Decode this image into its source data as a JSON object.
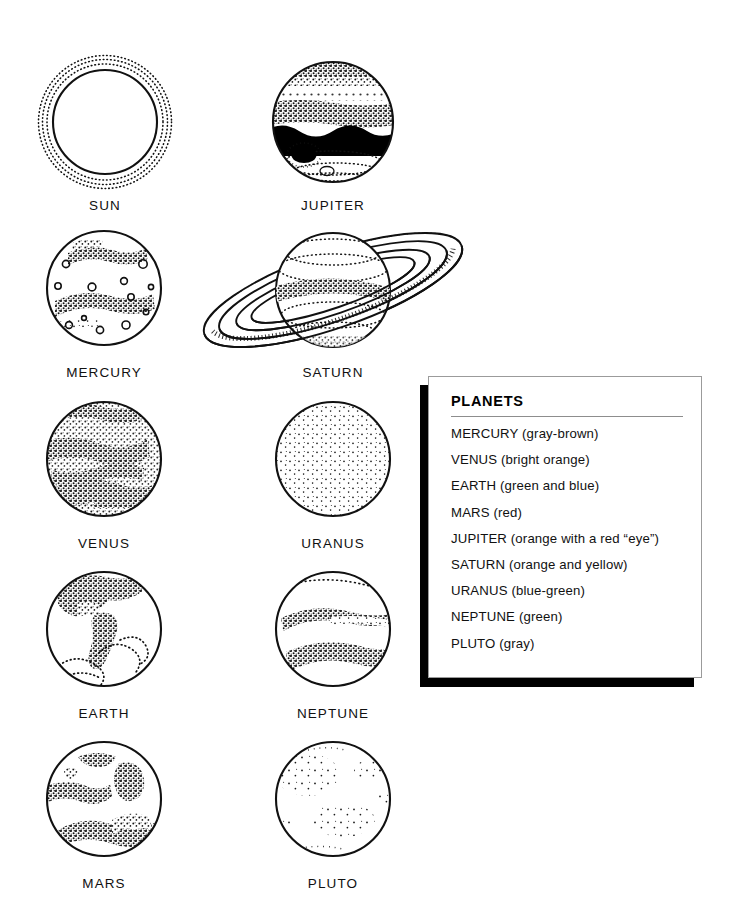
{
  "page": {
    "background": "#ffffff",
    "ink": "#000000"
  },
  "diagram": {
    "type": "illustration-grid",
    "columns": 2,
    "rows": 5,
    "bodies": [
      {
        "id": "sun",
        "label": "SUN",
        "style": "corona",
        "cx": 105,
        "cy": 122,
        "r": 52,
        "label_y": 198
      },
      {
        "id": "jupiter",
        "label": "JUPITER",
        "style": "banded",
        "cx": 333,
        "cy": 122,
        "r": 60,
        "label_y": 198
      },
      {
        "id": "mercury",
        "label": "MERCURY",
        "style": "cratered",
        "cx": 104,
        "cy": 288,
        "r": 57,
        "label_y": 365
      },
      {
        "id": "saturn",
        "label": "SATURN",
        "style": "ringed",
        "cx": 333,
        "cy": 290,
        "r": 57,
        "label_y": 365
      },
      {
        "id": "venus",
        "label": "VENUS",
        "style": "clouded",
        "cx": 104,
        "cy": 459,
        "r": 57,
        "label_y": 536
      },
      {
        "id": "uranus",
        "label": "URANUS",
        "style": "smooth",
        "cx": 333,
        "cy": 459,
        "r": 57,
        "label_y": 536
      },
      {
        "id": "earth",
        "label": "EARTH",
        "style": "continents",
        "cx": 104,
        "cy": 629,
        "r": 57,
        "label_y": 706
      },
      {
        "id": "neptune",
        "label": "NEPTUNE",
        "style": "streaked",
        "cx": 333,
        "cy": 629,
        "r": 57,
        "label_y": 706
      },
      {
        "id": "mars",
        "label": "MARS",
        "style": "patched",
        "cx": 104,
        "cy": 799,
        "r": 57,
        "label_y": 876
      },
      {
        "id": "pluto",
        "label": "PLUTO",
        "style": "speckled",
        "cx": 333,
        "cy": 799,
        "r": 57,
        "label_y": 876
      }
    ]
  },
  "legend": {
    "title": "PLANETS",
    "box": {
      "x": 428,
      "y": 376,
      "width": 274,
      "height": 302
    },
    "shadow": {
      "offset_x": -8,
      "offset_y": 9
    },
    "items": [
      {
        "name": "MERCURY",
        "color_note": "MERCURY (gray-brown)"
      },
      {
        "name": "VENUS",
        "color_note": "VENUS (bright orange)"
      },
      {
        "name": "EARTH",
        "color_note": "EARTH (green and blue)"
      },
      {
        "name": "MARS",
        "color_note": "MARS (red)"
      },
      {
        "name": "JUPITER",
        "color_note": "JUPITER (orange with a red “eye”)"
      },
      {
        "name": "SATURN",
        "color_note": "SATURN (orange and yellow)"
      },
      {
        "name": "URANUS",
        "color_note": "URANUS (blue-green)"
      },
      {
        "name": "NEPTUNE",
        "color_note": "NEPTUNE (green)"
      },
      {
        "name": "PLUTO",
        "color_note": "PLUTO (gray)"
      }
    ]
  }
}
